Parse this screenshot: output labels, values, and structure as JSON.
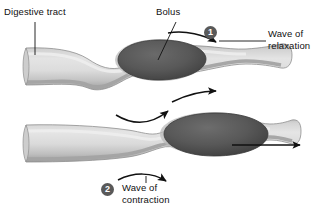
{
  "figure": {
    "width": 319,
    "height": 209
  },
  "labels": {
    "digestive_tract": "Digestive tract",
    "bolus": "Bolus",
    "wave_of_relaxation_line1": "Wave of",
    "wave_of_relaxation_line2": "relaxation",
    "wave_of_contraction_line1": "Wave of",
    "wave_of_contraction_line2": "contraction"
  },
  "markers": [
    {
      "id": "marker-1",
      "number": "1",
      "refers_to": "Wave of relaxation"
    },
    {
      "id": "marker-2",
      "number": "2",
      "refers_to": "Wave of contraction"
    }
  ],
  "panels": [
    {
      "id": "panel-top",
      "description": "Digestive tract with bolus at center; constriction behind bolus, relaxation ahead",
      "bolus_position": "center",
      "features": [
        "constriction-left",
        "bolus",
        "relaxed-segment-right"
      ]
    },
    {
      "id": "panel-bottom",
      "description": "Digestive tract with bolus moved right; contraction wave behind pushes bolus forward",
      "bolus_position": "right",
      "features": [
        "constriction-center",
        "bolus",
        "outflow-arrow-right"
      ]
    }
  ],
  "arrows": [
    {
      "id": "arrow-relaxation",
      "direction": "right",
      "panel": "panel-top",
      "meaning": "wave of relaxation ahead of bolus"
    },
    {
      "id": "arrow-top-under",
      "direction": "up-right",
      "panel": "panel-top",
      "meaning": "propagation of wave"
    },
    {
      "id": "arrow-bottom-over",
      "direction": "up-right",
      "panel": "panel-bottom",
      "meaning": "propagation of wave"
    },
    {
      "id": "arrow-contraction",
      "direction": "right-down",
      "panel": "panel-bottom",
      "meaning": "wave of contraction behind bolus"
    },
    {
      "id": "arrow-bolus-movement",
      "direction": "right",
      "panel": "panel-bottom",
      "meaning": "bolus propelled forward"
    }
  ],
  "colors": {
    "tube_fill_light": "#dcdcdc",
    "tube_fill_mid": "#c3c3c3",
    "tube_wall": "#a6a6a6",
    "tube_wall_dark": "#8f8f8f",
    "bolus_fill": "#575757",
    "bolus_edge": "#3d3d3d",
    "bolus_halo": "#b4b4b4",
    "marker_circle": "#595959",
    "marker_text": "#ffffff",
    "line": "#111111",
    "text": "#111111",
    "background": "#ffffff"
  }
}
